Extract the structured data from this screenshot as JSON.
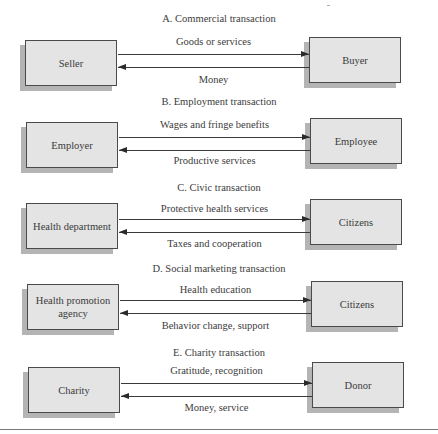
{
  "diagram": {
    "type": "exchange-transactions",
    "panels": [
      {
        "id": "A",
        "title": "A. Commercial transaction",
        "left_party": "Seller",
        "right_party": "Buyer",
        "top_flow": {
          "label": "Goods or services",
          "direction": "left-to-right"
        },
        "bottom_flow": {
          "label": "Money",
          "direction": "right-to-left"
        }
      },
      {
        "id": "B",
        "title": "B. Employment transaction",
        "left_party": "Employer",
        "right_party": "Employee",
        "top_flow": {
          "label": "Wages and fringe benefits",
          "direction": "left-to-right"
        },
        "bottom_flow": {
          "label": "Productive services",
          "direction": "right-to-left"
        }
      },
      {
        "id": "C",
        "title": "C. Civic transaction",
        "left_party": "Health department",
        "right_party": "Citizens",
        "top_flow": {
          "label": "Protective health services",
          "direction": "left-to-right"
        },
        "bottom_flow": {
          "label": "Taxes and cooperation",
          "direction": "right-to-left"
        }
      },
      {
        "id": "D",
        "title": "D. Social marketing transaction",
        "left_party": "Health promotion agency",
        "right_party": "Citizens",
        "top_flow": {
          "label": "Health education",
          "direction": "left-to-right"
        },
        "bottom_flow": {
          "label": "Behavior change, support",
          "direction": "right-to-left"
        }
      },
      {
        "id": "E",
        "title": "E. Charity transaction",
        "left_party": "Charity",
        "right_party": "Donor",
        "top_flow": {
          "label": "Gratitude, recognition",
          "direction": "left-to-right"
        },
        "bottom_flow": {
          "label": "Money, service",
          "direction": "right-to-left"
        }
      }
    ]
  },
  "colors": {
    "box_fill": "#e4e4e4",
    "box_border": "#4a4a4a",
    "box_shadow": "#b4b4b4",
    "arrow": "#3a3a3a",
    "text": "#3a3a3a"
  }
}
